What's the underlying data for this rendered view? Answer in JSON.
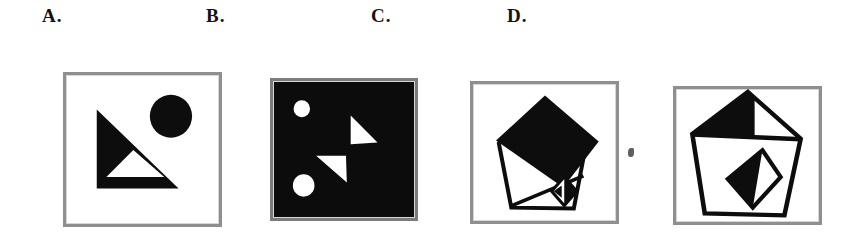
{
  "question": {
    "kind": "multiple-choice figure options",
    "options": [
      {
        "label": "A.",
        "figure_description": "White box: large black right triangle with a white triangular cutout at its base, solid black circle at upper right",
        "shapes": [
          "black-right-triangle",
          "white-inner-triangle",
          "black-circle"
        ]
      },
      {
        "label": "B.",
        "figure_description": "Black-filled box: small white circle upper left, larger white circle lower left, two white right triangles in the middle",
        "shapes": [
          "white-circle-small",
          "white-circle-large",
          "white-triangle-upper",
          "white-triangle-lower"
        ]
      },
      {
        "label": "C.",
        "figure_description": "White box: pentagon outline with large solid black diamond covering its top, diagonal line across lower half, small diamond with black right half at lower right",
        "shapes": [
          "pentagon-outline",
          "black-large-diamond",
          "diagonal-line",
          "small-half-filled-diamond"
        ]
      },
      {
        "label": "D.",
        "figure_description": "White box: pentagon outline with horizontal chord, upper-left half of top triangle filled black, centered diamond with black left half",
        "shapes": [
          "pentagon-outline",
          "black-top-left-triangle",
          "horizontal-chord",
          "half-filled-diamond"
        ]
      }
    ]
  },
  "colors": {
    "ink": "#0d0d0d",
    "box_border": "#8f8f8f",
    "box_b_background": "#0c0c0c",
    "page_background": "#ffffff"
  }
}
